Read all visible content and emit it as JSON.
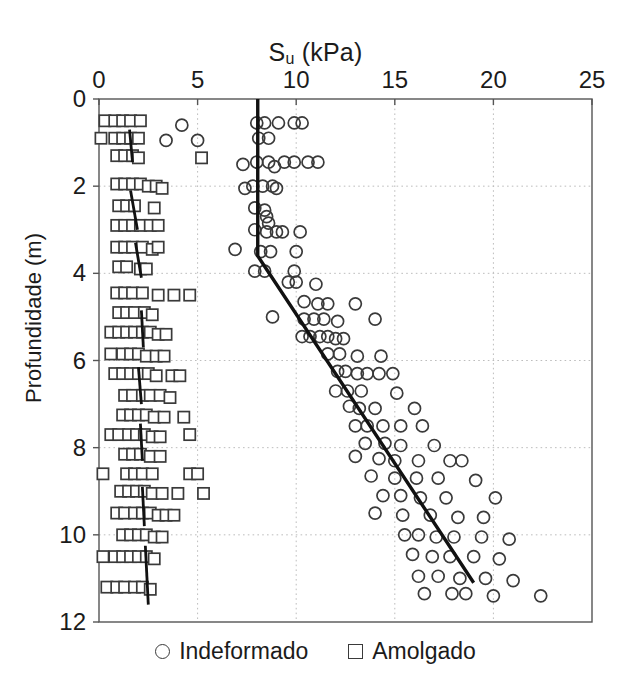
{
  "chart_data": {
    "type": "scatter",
    "title": "Su (kPa)",
    "title_base": "S",
    "title_sub": "u",
    "title_unit": " (kPa)",
    "xlabel": "Su (kPa)",
    "ylabel": "Profundidade (m)",
    "xlim": [
      0,
      25
    ],
    "ylim": [
      0,
      12
    ],
    "y_inverted": true,
    "grid": true,
    "xticks": [
      0,
      5,
      10,
      15,
      20,
      25
    ],
    "yticks": [
      0,
      2,
      4,
      6,
      8,
      10,
      12
    ],
    "xtick_labels": [
      "0",
      "5",
      "10",
      "15",
      "20",
      "25"
    ],
    "ytick_labels": [
      "0",
      "2",
      "4",
      "6",
      "8",
      "10",
      "12"
    ],
    "legend": {
      "position": "below-axes",
      "entries": [
        {
          "label": "Indeformado",
          "marker": "circle",
          "color": "#3a3a3a"
        },
        {
          "label": "Amolgado",
          "marker": "square",
          "color": "#3a3a3a"
        }
      ]
    },
    "series": [
      {
        "name": "Indeformado",
        "marker": "circle",
        "color": "#3a3a3a",
        "points": [
          [
            8.0,
            0.55
          ],
          [
            8.4,
            0.55
          ],
          [
            9.1,
            0.55
          ],
          [
            9.9,
            0.55
          ],
          [
            10.3,
            0.55
          ],
          [
            4.2,
            0.6
          ],
          [
            8.1,
            0.9
          ],
          [
            8.6,
            0.9
          ],
          [
            3.4,
            0.95
          ],
          [
            5.0,
            0.95
          ],
          [
            8.0,
            1.45
          ],
          [
            8.6,
            1.45
          ],
          [
            9.4,
            1.45
          ],
          [
            9.9,
            1.45
          ],
          [
            10.6,
            1.45
          ],
          [
            11.1,
            1.45
          ],
          [
            7.3,
            1.5
          ],
          [
            8.9,
            1.55
          ],
          [
            7.8,
            2.0
          ],
          [
            8.3,
            2.0
          ],
          [
            8.8,
            2.0
          ],
          [
            9.0,
            2.05
          ],
          [
            7.4,
            2.05
          ],
          [
            7.9,
            2.5
          ],
          [
            8.4,
            2.55
          ],
          [
            8.5,
            2.7
          ],
          [
            8.6,
            2.85
          ],
          [
            7.9,
            3.0
          ],
          [
            8.5,
            3.05
          ],
          [
            9.0,
            3.05
          ],
          [
            9.3,
            3.05
          ],
          [
            10.2,
            3.05
          ],
          [
            6.9,
            3.45
          ],
          [
            8.2,
            3.5
          ],
          [
            8.7,
            3.5
          ],
          [
            10.0,
            3.5
          ],
          [
            7.9,
            3.95
          ],
          [
            8.4,
            3.95
          ],
          [
            9.9,
            3.95
          ],
          [
            9.6,
            4.2
          ],
          [
            10.0,
            4.2
          ],
          [
            11.0,
            4.25
          ],
          [
            10.4,
            4.65
          ],
          [
            11.1,
            4.7
          ],
          [
            11.6,
            4.7
          ],
          [
            13.0,
            4.7
          ],
          [
            8.8,
            5.0
          ],
          [
            10.4,
            5.05
          ],
          [
            10.9,
            5.05
          ],
          [
            11.4,
            5.05
          ],
          [
            12.1,
            5.1
          ],
          [
            14.0,
            5.05
          ],
          [
            10.3,
            5.45
          ],
          [
            10.7,
            5.45
          ],
          [
            11.2,
            5.45
          ],
          [
            11.6,
            5.45
          ],
          [
            12.0,
            5.5
          ],
          [
            12.4,
            5.5
          ],
          [
            11.6,
            5.85
          ],
          [
            12.2,
            5.85
          ],
          [
            13.1,
            5.9
          ],
          [
            14.3,
            5.9
          ],
          [
            12.1,
            6.25
          ],
          [
            12.5,
            6.25
          ],
          [
            13.1,
            6.3
          ],
          [
            13.6,
            6.3
          ],
          [
            14.2,
            6.3
          ],
          [
            14.9,
            6.3
          ],
          [
            12.0,
            6.7
          ],
          [
            12.6,
            6.7
          ],
          [
            13.3,
            6.7
          ],
          [
            15.1,
            6.75
          ],
          [
            12.7,
            7.05
          ],
          [
            13.2,
            7.1
          ],
          [
            14.0,
            7.1
          ],
          [
            16.0,
            7.1
          ],
          [
            13.0,
            7.5
          ],
          [
            13.6,
            7.5
          ],
          [
            14.4,
            7.5
          ],
          [
            15.3,
            7.5
          ],
          [
            16.4,
            7.5
          ],
          [
            13.5,
            7.9
          ],
          [
            14.5,
            7.9
          ],
          [
            15.3,
            7.95
          ],
          [
            17.0,
            7.95
          ],
          [
            13.0,
            8.2
          ],
          [
            14.2,
            8.25
          ],
          [
            15.0,
            8.3
          ],
          [
            16.2,
            8.3
          ],
          [
            17.8,
            8.3
          ],
          [
            18.4,
            8.3
          ],
          [
            13.8,
            8.65
          ],
          [
            15.0,
            8.7
          ],
          [
            16.1,
            8.7
          ],
          [
            17.2,
            8.7
          ],
          [
            19.1,
            8.75
          ],
          [
            14.4,
            9.1
          ],
          [
            15.3,
            9.1
          ],
          [
            16.3,
            9.15
          ],
          [
            17.6,
            9.15
          ],
          [
            20.1,
            9.15
          ],
          [
            14.0,
            9.5
          ],
          [
            15.4,
            9.55
          ],
          [
            16.8,
            9.55
          ],
          [
            18.2,
            9.6
          ],
          [
            19.5,
            9.6
          ],
          [
            15.5,
            10.0
          ],
          [
            16.2,
            10.0
          ],
          [
            17.1,
            10.05
          ],
          [
            18.0,
            10.05
          ],
          [
            19.4,
            10.05
          ],
          [
            20.8,
            10.1
          ],
          [
            15.9,
            10.45
          ],
          [
            16.9,
            10.5
          ],
          [
            17.8,
            10.5
          ],
          [
            19.0,
            10.5
          ],
          [
            20.3,
            10.55
          ],
          [
            16.2,
            10.95
          ],
          [
            17.2,
            10.95
          ],
          [
            18.3,
            11.0
          ],
          [
            19.6,
            11.0
          ],
          [
            21.0,
            11.05
          ],
          [
            16.5,
            11.35
          ],
          [
            17.9,
            11.35
          ],
          [
            18.6,
            11.35
          ],
          [
            20.0,
            11.4
          ],
          [
            22.4,
            11.4
          ]
        ]
      },
      {
        "name": "Amolgado",
        "marker": "square",
        "color": "#3a3a3a",
        "points": [
          [
            0.3,
            0.5
          ],
          [
            0.8,
            0.5
          ],
          [
            1.2,
            0.5
          ],
          [
            1.6,
            0.5
          ],
          [
            2.1,
            0.5
          ],
          [
            0.1,
            0.9
          ],
          [
            0.8,
            0.9
          ],
          [
            1.2,
            0.9
          ],
          [
            1.6,
            0.9
          ],
          [
            2.0,
            0.9
          ],
          [
            0.9,
            1.3
          ],
          [
            1.3,
            1.3
          ],
          [
            1.7,
            1.3
          ],
          [
            2.0,
            1.35
          ],
          [
            5.2,
            1.35
          ],
          [
            0.9,
            1.95
          ],
          [
            1.3,
            1.95
          ],
          [
            1.7,
            1.95
          ],
          [
            2.1,
            1.95
          ],
          [
            2.5,
            2.0
          ],
          [
            2.9,
            2.0
          ],
          [
            3.2,
            2.05
          ],
          [
            1.0,
            2.45
          ],
          [
            1.4,
            2.45
          ],
          [
            1.8,
            2.45
          ],
          [
            2.8,
            2.5
          ],
          [
            0.9,
            2.9
          ],
          [
            1.3,
            2.9
          ],
          [
            1.7,
            2.9
          ],
          [
            2.1,
            2.9
          ],
          [
            2.6,
            2.9
          ],
          [
            3.0,
            2.9
          ],
          [
            0.9,
            3.4
          ],
          [
            1.3,
            3.4
          ],
          [
            1.7,
            3.4
          ],
          [
            2.2,
            3.4
          ],
          [
            2.7,
            3.45
          ],
          [
            3.0,
            3.4
          ],
          [
            1.0,
            3.85
          ],
          [
            1.4,
            3.85
          ],
          [
            2.1,
            3.9
          ],
          [
            2.4,
            3.9
          ],
          [
            0.9,
            4.45
          ],
          [
            1.3,
            4.45
          ],
          [
            1.7,
            4.45
          ],
          [
            2.2,
            4.45
          ],
          [
            3.0,
            4.5
          ],
          [
            3.8,
            4.5
          ],
          [
            4.6,
            4.5
          ],
          [
            1.0,
            4.9
          ],
          [
            1.4,
            4.9
          ],
          [
            1.8,
            4.9
          ],
          [
            2.3,
            4.9
          ],
          [
            2.7,
            4.95
          ],
          [
            0.6,
            5.35
          ],
          [
            1.0,
            5.35
          ],
          [
            1.4,
            5.35
          ],
          [
            1.8,
            5.35
          ],
          [
            2.2,
            5.35
          ],
          [
            2.6,
            5.35
          ],
          [
            3.0,
            5.4
          ],
          [
            3.4,
            5.4
          ],
          [
            0.6,
            5.85
          ],
          [
            1.2,
            5.85
          ],
          [
            1.6,
            5.85
          ],
          [
            2.0,
            5.85
          ],
          [
            2.4,
            5.9
          ],
          [
            2.9,
            5.9
          ],
          [
            3.3,
            5.9
          ],
          [
            0.8,
            6.3
          ],
          [
            1.2,
            6.3
          ],
          [
            1.6,
            6.3
          ],
          [
            2.0,
            6.3
          ],
          [
            2.5,
            6.3
          ],
          [
            2.9,
            6.35
          ],
          [
            3.7,
            6.35
          ],
          [
            4.1,
            6.35
          ],
          [
            1.3,
            6.8
          ],
          [
            1.7,
            6.8
          ],
          [
            2.2,
            6.8
          ],
          [
            2.6,
            6.8
          ],
          [
            3.1,
            6.8
          ],
          [
            3.6,
            6.85
          ],
          [
            1.2,
            7.25
          ],
          [
            1.6,
            7.25
          ],
          [
            2.0,
            7.25
          ],
          [
            2.4,
            7.25
          ],
          [
            2.8,
            7.3
          ],
          [
            3.3,
            7.3
          ],
          [
            4.3,
            7.3
          ],
          [
            0.6,
            7.7
          ],
          [
            1.0,
            7.7
          ],
          [
            1.5,
            7.7
          ],
          [
            1.9,
            7.7
          ],
          [
            2.3,
            7.7
          ],
          [
            2.7,
            7.75
          ],
          [
            3.1,
            7.75
          ],
          [
            4.6,
            7.7
          ],
          [
            1.3,
            8.15
          ],
          [
            1.7,
            8.15
          ],
          [
            2.1,
            8.15
          ],
          [
            2.6,
            8.2
          ],
          [
            3.1,
            8.2
          ],
          [
            0.2,
            8.6
          ],
          [
            1.4,
            8.6
          ],
          [
            1.8,
            8.6
          ],
          [
            2.2,
            8.6
          ],
          [
            2.7,
            8.6
          ],
          [
            4.6,
            8.6
          ],
          [
            5.0,
            8.6
          ],
          [
            1.1,
            9.0
          ],
          [
            1.5,
            9.0
          ],
          [
            1.9,
            9.0
          ],
          [
            2.3,
            9.0
          ],
          [
            2.7,
            9.05
          ],
          [
            3.2,
            9.05
          ],
          [
            4.0,
            9.05
          ],
          [
            5.3,
            9.05
          ],
          [
            0.9,
            9.5
          ],
          [
            1.3,
            9.5
          ],
          [
            1.8,
            9.5
          ],
          [
            2.2,
            9.5
          ],
          [
            2.6,
            9.5
          ],
          [
            3.0,
            9.55
          ],
          [
            3.4,
            9.55
          ],
          [
            3.8,
            9.55
          ],
          [
            1.2,
            10.0
          ],
          [
            1.6,
            10.0
          ],
          [
            2.0,
            10.0
          ],
          [
            2.4,
            10.0
          ],
          [
            2.8,
            10.05
          ],
          [
            3.2,
            10.05
          ],
          [
            0.2,
            10.5
          ],
          [
            0.8,
            10.5
          ],
          [
            1.2,
            10.5
          ],
          [
            1.6,
            10.5
          ],
          [
            2.0,
            10.5
          ],
          [
            2.4,
            10.5
          ],
          [
            2.8,
            10.55
          ],
          [
            0.4,
            11.2
          ],
          [
            0.9,
            11.2
          ],
          [
            1.3,
            11.2
          ],
          [
            1.8,
            11.2
          ],
          [
            2.2,
            11.2
          ],
          [
            2.6,
            11.25
          ]
        ]
      }
    ],
    "trend_lines": [
      {
        "name": "indeformado-trend",
        "color": "#111111",
        "width": 3.4,
        "vertices": [
          [
            8.05,
            0.0
          ],
          [
            8.05,
            3.6
          ],
          [
            19.0,
            11.1
          ]
        ]
      },
      {
        "name": "amolgado-seg-1",
        "color": "#111111",
        "width": 2.8,
        "vertices": [
          [
            1.55,
            0.7
          ],
          [
            1.7,
            1.45
          ]
        ]
      },
      {
        "name": "amolgado-seg-2",
        "color": "#111111",
        "width": 2.8,
        "vertices": [
          [
            1.6,
            2.1
          ],
          [
            1.95,
            3.0
          ]
        ]
      },
      {
        "name": "amolgado-seg-3",
        "color": "#111111",
        "width": 2.8,
        "vertices": [
          [
            1.85,
            3.3
          ],
          [
            2.15,
            4.1
          ]
        ]
      },
      {
        "name": "amolgado-seg-4",
        "color": "#111111",
        "width": 2.8,
        "vertices": [
          [
            2.15,
            4.85
          ],
          [
            2.25,
            5.7
          ]
        ]
      },
      {
        "name": "amolgado-seg-5",
        "color": "#111111",
        "width": 2.8,
        "vertices": [
          [
            2.0,
            6.15
          ],
          [
            2.15,
            7.0
          ]
        ]
      },
      {
        "name": "amolgado-seg-6",
        "color": "#111111",
        "width": 2.8,
        "vertices": [
          [
            2.1,
            7.45
          ],
          [
            2.2,
            8.3
          ]
        ]
      },
      {
        "name": "amolgado-seg-7",
        "color": "#111111",
        "width": 2.8,
        "vertices": [
          [
            2.2,
            8.9
          ],
          [
            2.3,
            9.8
          ]
        ]
      },
      {
        "name": "amolgado-seg-8",
        "color": "#111111",
        "width": 2.8,
        "vertices": [
          [
            2.35,
            10.25
          ],
          [
            2.5,
            11.6
          ]
        ]
      }
    ]
  },
  "axes": {
    "frame_color": "#555555",
    "grid_color": "#bdbdbd"
  }
}
